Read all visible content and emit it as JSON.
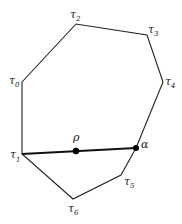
{
  "diagram": {
    "type": "polygon-with-segment",
    "vertices": [
      {
        "id": "tau0",
        "symbol": "τ",
        "sub": "0",
        "x": 22,
        "y": 82
      },
      {
        "id": "tau2",
        "symbol": "τ",
        "sub": "2",
        "x": 76,
        "y": 24
      },
      {
        "id": "tau3",
        "symbol": "τ",
        "sub": "3",
        "x": 147,
        "y": 35
      },
      {
        "id": "tau4",
        "symbol": "τ",
        "sub": "4",
        "x": 163,
        "y": 82
      },
      {
        "id": "alpha",
        "symbol": "α",
        "x": 136,
        "y": 148
      },
      {
        "id": "tau5",
        "symbol": "τ",
        "sub": "5",
        "x": 121,
        "y": 175
      },
      {
        "id": "tau6",
        "symbol": "τ",
        "sub": "6",
        "x": 73,
        "y": 199
      },
      {
        "id": "tau1",
        "symbol": "τ",
        "sub": "1",
        "x": 22,
        "y": 154
      }
    ],
    "segment": {
      "from": "tau1",
      "to": "alpha",
      "points": [
        "rho",
        "alpha"
      ]
    },
    "labels": {
      "tau0": {
        "sym": "τ",
        "sub": "0"
      },
      "tau1": {
        "sym": "τ",
        "sub": "1"
      },
      "tau2": {
        "sym": "τ",
        "sub": "2"
      },
      "tau3": {
        "sym": "τ",
        "sub": "3"
      },
      "tau4": {
        "sym": "τ",
        "sub": "4"
      },
      "tau5": {
        "sym": "τ",
        "sub": "5"
      },
      "tau6": {
        "sym": "τ",
        "sub": "6"
      },
      "rho": "ρ",
      "alpha": "α"
    }
  }
}
